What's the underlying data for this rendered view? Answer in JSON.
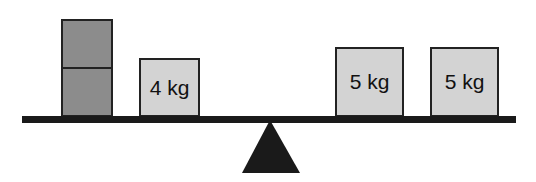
{
  "diagram": {
    "type": "balance-scale",
    "left_side": {
      "blocks": [
        {
          "label": "",
          "shade": "dark",
          "stack_position": "top"
        },
        {
          "label": "",
          "shade": "dark",
          "stack_position": "bottom"
        },
        {
          "label": "4 kg",
          "shade": "light"
        }
      ]
    },
    "right_side": {
      "blocks": [
        {
          "label": "5 kg",
          "shade": "light"
        },
        {
          "label": "5 kg",
          "shade": "light"
        }
      ]
    },
    "colors": {
      "beam": "#1a1a1a",
      "fulcrum": "#1a1a1a",
      "unknown_block": "#8c8c8c",
      "labeled_block": "#d3d3d3"
    }
  }
}
